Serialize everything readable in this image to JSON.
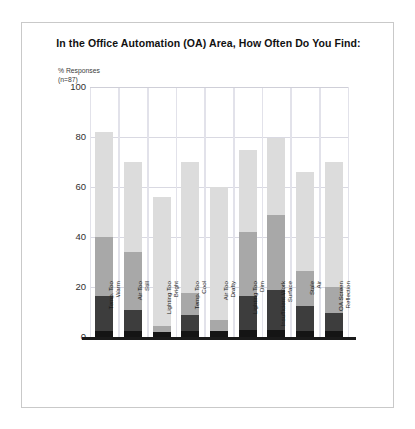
{
  "chart_data": {
    "type": "bar",
    "subtype": "stacked-bar",
    "title": "In the Office Automation (OA) Area, How Often Do You Find:",
    "ylabel": "% Responses\n(n=87)",
    "xlabel": "",
    "ylim": [
      0,
      100
    ],
    "yticks": [
      0,
      20,
      40,
      60,
      80,
      100
    ],
    "grid": true,
    "legend_position": "none",
    "categories": [
      "Temp. Too Warm",
      "Air Too Still",
      "Lighting Too Bright",
      "Temp. Too Cool",
      "Air Too Drafty",
      "Lighting Too Dim",
      "Insufficient Work Surface",
      "Stale Air",
      "OA Screen Reflection"
    ],
    "series": [
      {
        "name": "segment-1-bottom",
        "color": "#141414",
        "values": [
          2.5,
          2.5,
          2,
          2.5,
          2.5,
          3,
          3,
          2.5,
          2.5
        ]
      },
      {
        "name": "segment-2",
        "color": "#3d3d3d",
        "values": [
          14,
          8.5,
          0,
          6.5,
          0,
          13.5,
          16,
          10,
          7
        ]
      },
      {
        "name": "segment-3",
        "color": "#a8a8a8",
        "values": [
          23.5,
          23,
          2.5,
          8.5,
          4.5,
          25.5,
          30,
          14,
          10.5
        ]
      },
      {
        "name": "segment-4-top",
        "color": "#dcdcdc",
        "values": [
          42,
          36,
          51.5,
          52.5,
          53,
          33,
          30.5,
          39.5,
          50
        ]
      }
    ],
    "totals": [
      82,
      70,
      56,
      70,
      60,
      75,
      79.5,
      66,
      70
    ]
  }
}
